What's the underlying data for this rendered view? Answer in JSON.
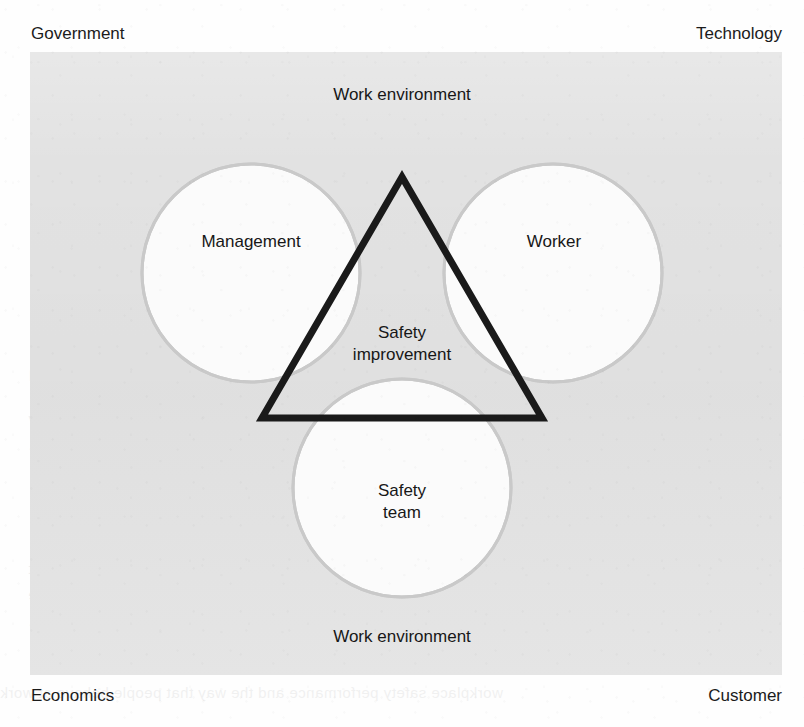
{
  "figure": {
    "kind": "venn-triangle-diagram",
    "caption_absent": true
  },
  "context_labels": {
    "top_left": "Government",
    "top_right": "Technology",
    "bottom_left": "Economics",
    "bottom_right": "Customer"
  },
  "environment_labels": {
    "top": "Work environment",
    "bottom": "Work environment"
  },
  "circles": [
    {
      "id": "management",
      "label": "Management",
      "cx": 251,
      "cy": 273,
      "r": 109
    },
    {
      "id": "worker",
      "label": "Worker",
      "cx": 553,
      "cy": 273,
      "r": 109
    },
    {
      "id": "safety-team",
      "label": "Safety\nteam",
      "cx": 402,
      "cy": 488,
      "r": 109
    }
  ],
  "intersection": {
    "id": "safety-improvement",
    "label": "Safety\nimprovement"
  },
  "triangle": {
    "id": "safety-triangle",
    "apex": {
      "x": 402,
      "y": 177
    },
    "bottom_left": {
      "x": 262,
      "y": 418
    },
    "bottom_right": {
      "x": 542,
      "y": 418
    },
    "stroke_width": 7
  },
  "colors": {
    "plate_background": "#e2e2e2",
    "circle_fill": "#fbfbfb",
    "circle_stroke": "#c9c9c9",
    "triangle_stroke": "#1a1a1a",
    "text": "#171717",
    "page_background": "#fefefe"
  },
  "bleed_through": {
    "note": "faint mirrored text showing through from the reverse side of the scanned page",
    "title": "Occupational fit theory",
    "subtitle": "Making sure that your people are up to it",
    "heading": "Introduction",
    "lines": [
      "Over the years there have been many attempts to explain why",
      "workers behave as they do when it comes to safety at work.",
      "Some of these explanations have been based on the idea that",
      "the people involved are somehow at fault, whilst others have",
      "looked at the way that the work is organised and managed."
    ],
    "band": "workplace safety performance and the way that people behave at work"
  }
}
